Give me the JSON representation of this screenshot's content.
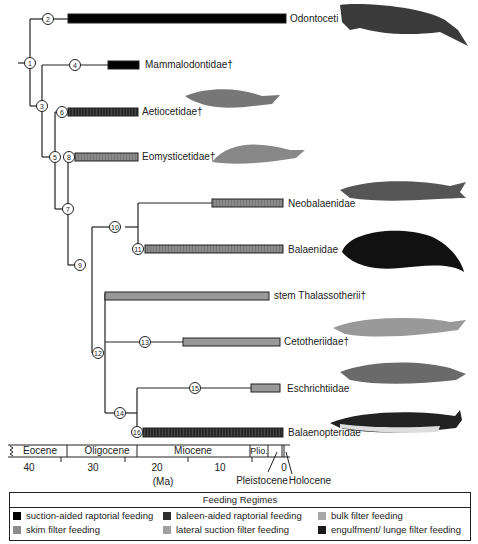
{
  "taxa": [
    {
      "id": "odontoceti",
      "label": "Odontoceti",
      "regime": "suction-aided raptorial feeding",
      "color": "#000000"
    },
    {
      "id": "mammalodontidae",
      "label": "Mammalodontidae†",
      "regime": "suction-aided raptorial feeding",
      "color": "#000000"
    },
    {
      "id": "aetiocetidae",
      "label": "Aetiocetidae†",
      "regime": "baleen-aided raptorial feeding",
      "color": "#2b2b2b"
    },
    {
      "id": "eomysticetidae",
      "label": "Eomysticetidae†",
      "regime": "skim filter feeding",
      "color": "#8c8c8c"
    },
    {
      "id": "neobalaenidae",
      "label": "Neobalaenidae",
      "regime": "skim filter feeding",
      "color": "#8c8c8c"
    },
    {
      "id": "balaenidae",
      "label": "Balaenidae",
      "regime": "skim filter feeding",
      "color": "#8c8c8c"
    },
    {
      "id": "stem-thalassotherii",
      "label": "stem Thalassotherii†",
      "regime": "bulk filter feeding",
      "color": "#9a9a9a"
    },
    {
      "id": "cetotheriidae",
      "label": "Cetotheriidae†",
      "regime": "bulk filter feeding",
      "color": "#9a9a9a"
    },
    {
      "id": "eschrichtiidae",
      "label": "Eschrichtiidae",
      "regime": "lateral suction filter feeding",
      "color": "#8c8c8c"
    },
    {
      "id": "balaenopteridae",
      "label": "Balaenopteridae",
      "regime": "engulfment/ lunge filter feeding",
      "color": "#111111"
    }
  ],
  "nodes": [
    "1",
    "2",
    "3",
    "4",
    "5",
    "6",
    "7",
    "8",
    "9",
    "10",
    "11",
    "12",
    "13",
    "14",
    "15",
    "16"
  ],
  "timescale": {
    "epochs": [
      "Eocene",
      "Oligocene",
      "Miocene",
      "Plio."
    ],
    "ticks": [
      "40",
      "30",
      "20",
      "10",
      "0"
    ],
    "unit": "(Ma)",
    "callouts": [
      "Pleistocene",
      "Holocene"
    ]
  },
  "legend": {
    "title": "Feeding Regimes",
    "items": [
      {
        "label": "suction-aided raptorial feeding",
        "color": "#000000"
      },
      {
        "label": "baleen-aided raptorial feeding",
        "color": "#2e2e2e"
      },
      {
        "label": "bulk filter feeding",
        "color": "#a8a8a8"
      },
      {
        "label": "skim filter feeding",
        "color": "#8c8c8c"
      },
      {
        "label": "lateral suction filter feeding",
        "color": "#a0a0a0"
      },
      {
        "label": "engulfment/ lunge  filter feeding",
        "color": "#1a1a1a"
      }
    ]
  }
}
